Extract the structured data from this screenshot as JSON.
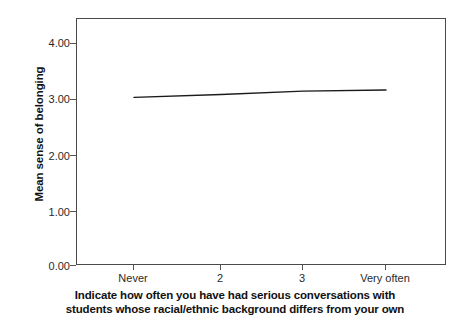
{
  "chart_data": {
    "type": "line",
    "title": "",
    "subtitle": "",
    "categories": [
      "Never",
      "2",
      "3",
      "Very often"
    ],
    "values": [
      2.97,
      3.02,
      3.08,
      3.1
    ],
    "series": [
      {
        "name": "Mean sense of belonging",
        "values": [
          2.97,
          3.02,
          3.08,
          3.1
        ]
      }
    ],
    "xlabel_line1": "Indicate how often you have had serious conversations with",
    "xlabel_line2": "students whose racial/ethnic background differs from your own",
    "ylabel": "Mean sense of belonging",
    "ylim": [
      0.0,
      4.35
    ],
    "yticks": [
      0.0,
      1.0,
      2.0,
      3.0,
      4.0
    ],
    "ytick_labels": [
      "0.00",
      "1.00",
      "2.00",
      "3.00",
      "4.00"
    ],
    "xtick_labels": [
      "Never",
      "2",
      "3",
      "Very often"
    ],
    "grid": false,
    "legend": false,
    "legend_position": "none",
    "line_color": "#1a1a1a",
    "frame_color": "#4a4a4a",
    "background_color": "#ffffff"
  }
}
